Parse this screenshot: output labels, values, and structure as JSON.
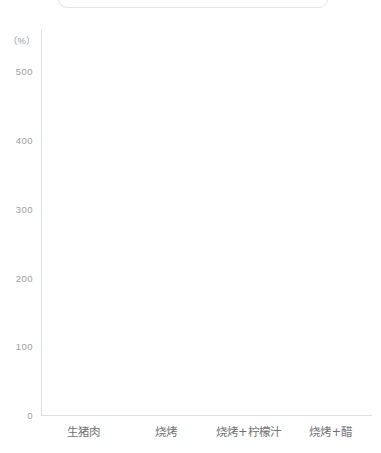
{
  "top_card": {
    "text": "",
    "visible": true
  },
  "chart_data": {
    "type": "bar",
    "title": "",
    "subtitle": "",
    "xlabel": "",
    "ylabel": "",
    "unit_label": "（%）",
    "categories": [
      "生猪肉",
      "烧烤",
      "烧烤+柠檬汁",
      "烧烤+醋"
    ],
    "values": [
      null,
      null,
      null,
      null
    ],
    "series": [
      {
        "name": "",
        "values": [
          null,
          null,
          null,
          null
        ]
      }
    ],
    "yticks": [
      "0",
      "100",
      "200",
      "300",
      "400",
      "500"
    ],
    "ytick_values": [
      0,
      100,
      200,
      300,
      400,
      500
    ],
    "ylim": [
      0,
      560
    ],
    "grid": false,
    "legend": [],
    "legend_position": "none",
    "annotations": [],
    "axis_color": "#dcdee0",
    "tick_label_color": "#9a9da1",
    "category_label_color": "#6f7276",
    "plot_background": "#ffffff"
  }
}
